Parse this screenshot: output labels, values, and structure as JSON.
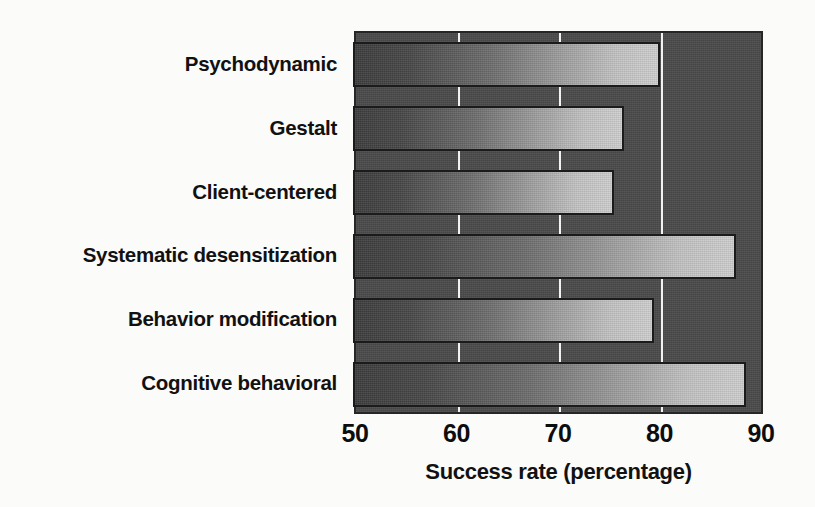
{
  "chart_data": {
    "type": "bar",
    "orientation": "horizontal",
    "title": "",
    "xlabel": "Success rate (percentage)",
    "ylabel": "",
    "xlim": [
      50,
      90
    ],
    "xticks": [
      50,
      60,
      70,
      80,
      90
    ],
    "xtick_labels": [
      "50",
      "60",
      "70",
      "80",
      "90"
    ],
    "grid": true,
    "grid_axis": "x",
    "legend": false,
    "categories": [
      "Psychodynamic",
      "Gestalt",
      "Client-centered",
      "Systematic desensitization",
      "Behavior modification",
      "Cognitive behavioral"
    ],
    "values": [
      80,
      76.5,
      75.5,
      87.5,
      79.5,
      88.5
    ],
    "bars": [
      {
        "category": "Psychodynamic",
        "value": 80
      },
      {
        "category": "Gestalt",
        "value": 76.5
      },
      {
        "category": "Client-centered",
        "value": 75.5
      },
      {
        "category": "Systematic desensitization",
        "value": 87.5
      },
      {
        "category": "Behavior modification",
        "value": 79.5
      },
      {
        "category": "Cognitive behavioral",
        "value": 88.5
      }
    ],
    "colors": {
      "plot_background": "#4a4a4a",
      "plot_border": "#262626",
      "gridline": "#f2f2f2",
      "bar_gradient_start": "#3d3d3d",
      "bar_gradient_end": "#cfcfcf",
      "bar_border": "#1b1b1b",
      "text": "#111111",
      "page_background": "#fbfbfa"
    }
  }
}
